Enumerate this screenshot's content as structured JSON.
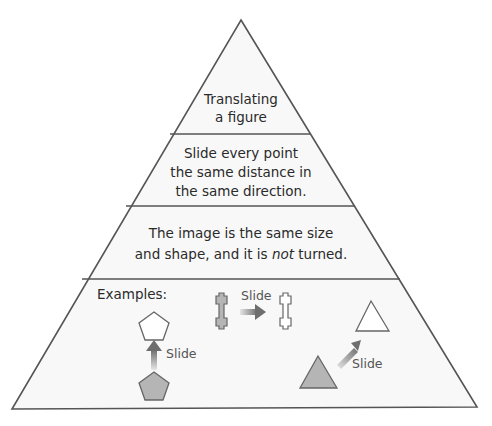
{
  "diagram": {
    "levels": [
      {
        "lines": [
          "Translating",
          "a figure"
        ]
      },
      {
        "lines": [
          "Slide every point",
          "the same distance in",
          "the same direction."
        ]
      },
      {
        "line1": "The image is the same size",
        "line2_pre": "and shape, and it is ",
        "line2_em": "not",
        "line2_post": " turned."
      },
      {
        "heading": "Examples:"
      }
    ],
    "examples": [
      {
        "shape": "pentagon",
        "direction": "up",
        "label": "Slide"
      },
      {
        "shape": "cross-bar",
        "direction": "right",
        "label": "Slide"
      },
      {
        "shape": "triangle",
        "direction": "up-right",
        "label": "Slide"
      }
    ],
    "colors": {
      "outline": "#555555",
      "fill_original": "#b5b5b5",
      "fill_image": "#ffffff",
      "arrow": "#777777",
      "band_bg": "#f7f7f7"
    }
  }
}
